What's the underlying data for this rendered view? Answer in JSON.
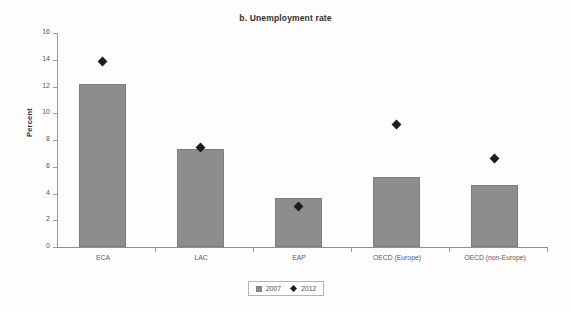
{
  "chart_data": {
    "type": "bar",
    "title": "b. Unemployment rate",
    "xlabel": "",
    "ylabel": "Percent",
    "ylim": [
      0,
      16
    ],
    "ytick_step": 2,
    "yticks": [
      "16",
      "14",
      "12",
      "10",
      "8",
      "6",
      "4",
      "2",
      "0"
    ],
    "grid": false,
    "legend_position": "bottom-center",
    "categories": [
      "ECA",
      "LAC",
      "EAP",
      "OECD (Europe)",
      "OECD (non-Europe)"
    ],
    "series": [
      {
        "name": "2007",
        "type": "bar",
        "color": "#8d8d8d",
        "values": [
          12.2,
          7.3,
          3.65,
          5.2,
          4.65
        ]
      },
      {
        "name": "2012",
        "type": "scatter",
        "marker": "diamond",
        "color": "#1d1d1d",
        "values": [
          13.85,
          7.45,
          3.0,
          9.15,
          6.65
        ]
      }
    ]
  },
  "legend": {
    "entries": [
      {
        "label": "2007",
        "marker": "square-swatch"
      },
      {
        "label": "2012",
        "marker": "diamond-swatch"
      }
    ]
  }
}
